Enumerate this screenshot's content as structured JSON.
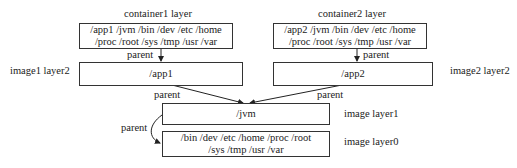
{
  "container1": {
    "title": "container1 layer",
    "line1": "/app1  /jvm  /bin  /dev  /etc  /home",
    "line2": "/proc  /root  /sys  /tmp  /usr  /var"
  },
  "container2": {
    "title": "container2 layer",
    "line1": "/app2  /jvm  /bin  /dev  /etc  /home",
    "line2": "/proc  /root  /sys  /tmp  /usr  /var"
  },
  "image1_layer2": {
    "label": "image1 layer2",
    "content": "/app1"
  },
  "image2_layer2": {
    "label": "image2 layer2",
    "content": "/app2"
  },
  "image_layer1": {
    "label": "image layer1",
    "content": "/jvm"
  },
  "image_layer0": {
    "label": "image layer0",
    "line1": "/bin  /dev  /etc  /home /proc /root",
    "line2": "/sys  /tmp  /usr  /var"
  },
  "edges": {
    "c1_parent": "parent",
    "c2_parent": "parent",
    "i1_parent": "parent",
    "i2_parent": "parent",
    "l1_parent": "parent"
  }
}
